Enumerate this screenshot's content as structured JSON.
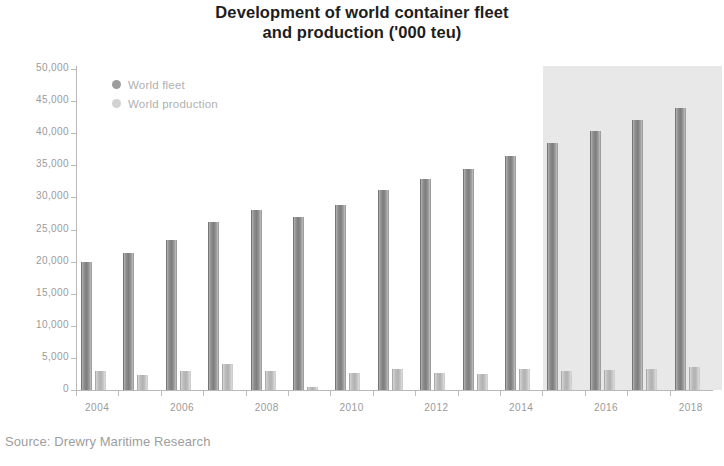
{
  "chart_data": {
    "type": "bar",
    "title": "Development of world container fleet and production ('000 teu)",
    "title_lines": [
      "Development of world container fleet",
      "and production ('000 teu)"
    ],
    "xlabel": "",
    "ylabel": "",
    "ylim": [
      0,
      50000
    ],
    "ytick_step": 5000,
    "grid": false,
    "legend_position": "top-left",
    "categories": [
      "2004",
      "2005",
      "2006",
      "2007",
      "2008",
      "2009",
      "2010",
      "2011",
      "2012",
      "2013",
      "2014",
      "2015",
      "2016",
      "2017",
      "2018"
    ],
    "tick_labels": [
      "2004",
      "2006",
      "2008",
      "2010",
      "2012",
      "2014",
      "2016",
      "2018"
    ],
    "ytick_labels": [
      "0",
      "5,000",
      "10,000",
      "15,000",
      "20,000",
      "25,000",
      "30,000",
      "35,000",
      "40,000",
      "45,000",
      "50,000"
    ],
    "series": [
      {
        "name": "World fleet",
        "color": "#8f8f8f",
        "values": [
          20000,
          21400,
          23300,
          26200,
          28000,
          26900,
          28800,
          31200,
          32800,
          34500,
          36500,
          38500,
          40300,
          42000,
          44000
        ]
      },
      {
        "name": "World production",
        "color": "#c2c2c2",
        "values": [
          3000,
          2400,
          3000,
          4000,
          2900,
          500,
          2600,
          3200,
          2700,
          2500,
          3200,
          3000,
          3100,
          3200,
          3600
        ]
      }
    ],
    "annotations": [
      {
        "type": "shaded-band",
        "label": "forecast",
        "from": "2015",
        "to": "2018",
        "color": "#e8e8e8"
      }
    ],
    "source": "Source: Drewry Maritime Research"
  },
  "legend": {
    "items": [
      {
        "label": "World fleet",
        "icon": "legend-dot-fleet"
      },
      {
        "label": "World production",
        "icon": "legend-dot-production"
      }
    ]
  },
  "footer": {
    "source": "Source: Drewry Maritime Research"
  }
}
